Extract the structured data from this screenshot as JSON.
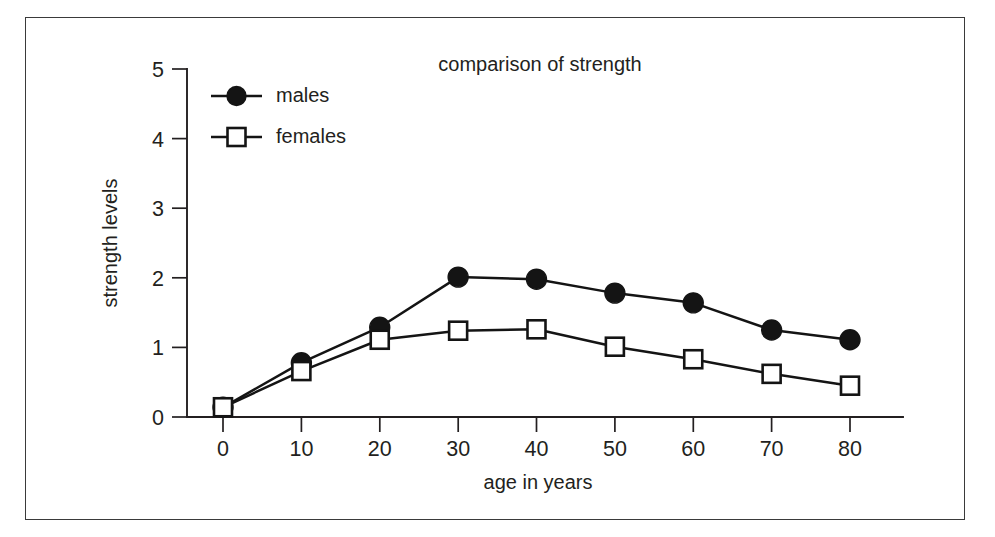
{
  "chart_data": {
    "type": "line",
    "title": "comparison of strength",
    "xlabel": "age in years",
    "ylabel": "strength levels",
    "x": [
      0,
      10,
      20,
      30,
      40,
      50,
      60,
      70,
      80
    ],
    "xticklabels": [
      "0",
      "10",
      "20",
      "30",
      "40",
      "50",
      "60",
      "70",
      "80"
    ],
    "yticklabels": [
      "0",
      "1",
      "2",
      "3",
      "4",
      "5"
    ],
    "yticks": [
      0,
      1,
      2,
      3,
      4,
      5
    ],
    "xlim": [
      0,
      80
    ],
    "ylim": [
      0,
      5
    ],
    "grid": false,
    "legend_position": "upper left",
    "series": [
      {
        "name": "males",
        "marker": "filled-circle",
        "color": "#141414",
        "values": [
          0.14,
          0.78,
          1.29,
          2.01,
          1.98,
          1.78,
          1.64,
          1.25,
          1.11
        ]
      },
      {
        "name": "females",
        "marker": "open-square",
        "color": "#141414",
        "values": [
          0.14,
          0.66,
          1.11,
          1.24,
          1.26,
          1.01,
          0.83,
          0.62,
          0.45
        ]
      }
    ]
  },
  "legend": {
    "items": [
      {
        "label": "males"
      },
      {
        "label": "females"
      }
    ]
  },
  "axes": {
    "x_title": "age in years",
    "y_title": "strength levels"
  },
  "colors": {
    "ink": "#231f20",
    "series": "#141414",
    "frame": "#3a3a3a",
    "background": "#ffffff"
  }
}
